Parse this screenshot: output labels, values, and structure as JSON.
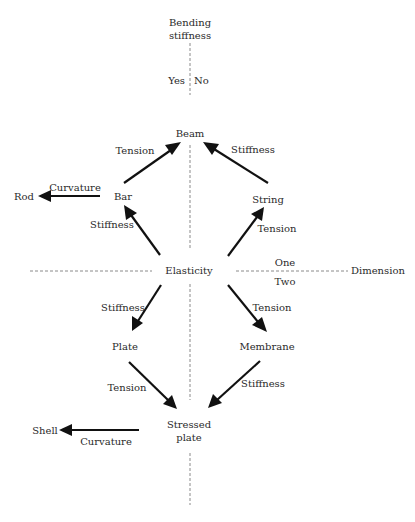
{
  "diagram": {
    "axes": {
      "vertical": {
        "title_line1": "Bending",
        "title_line2": "stiffness",
        "left_label": "Yes",
        "right_label": "No"
      },
      "horizontal": {
        "title": "Dimension",
        "upper_label": "One",
        "lower_label": "Two"
      }
    },
    "nodes": {
      "beam": "Beam",
      "bar": "Bar",
      "rod": "Rod",
      "string": "String",
      "elasticity": "Elasticity",
      "plate": "Plate",
      "membrane": "Membrane",
      "stressed_plate_line1": "Stressed",
      "stressed_plate_line2": "plate",
      "shell": "Shell"
    },
    "edges": {
      "bar_to_beam": "Tension",
      "string_to_beam": "Stiffness",
      "bar_to_rod": "Curvature",
      "elasticity_to_bar": "Stiffness",
      "elasticity_to_string": "Tension",
      "elasticity_to_plate": "Stiffness",
      "elasticity_to_membrane": "Tension",
      "plate_to_stressed": "Tension",
      "membrane_to_stressed": "Stiffness",
      "stressed_to_shell": "Curvature"
    }
  }
}
